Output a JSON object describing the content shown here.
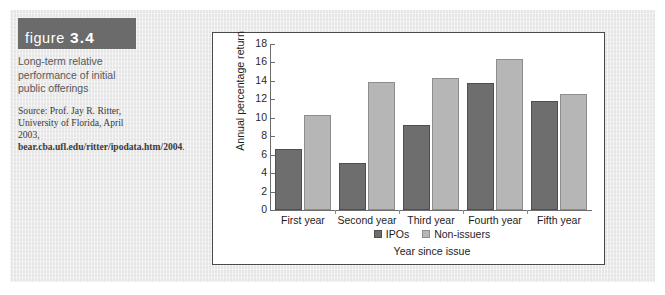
{
  "figure": {
    "banner_label": "figure",
    "banner_number": "3.4",
    "caption": "Long-term relative performance of initial public offerings",
    "source_prefix": "Source: Prof. Jay R. Ritter, University of Florida, April 2003, ",
    "source_url": "bear.cba.ufl.edu/ritter/ipodata.htm/2004",
    "source_suffix": "."
  },
  "colors": {
    "banner_bg": "#6b6b6b",
    "page_bg": "#e6e6e6",
    "series_ipos": "#6e6e6e",
    "series_nonissuers": "#b6b6b6",
    "axis": "#6d6d6d"
  },
  "chart_data": {
    "type": "bar",
    "title": "",
    "xlabel": "Year since issue",
    "ylabel": "Annual percentage return",
    "categories": [
      "First year",
      "Second year",
      "Third year",
      "Fourth year",
      "Fifth year"
    ],
    "series": [
      {
        "name": "IPOs",
        "values": [
          6.6,
          5.1,
          9.2,
          13.8,
          11.8
        ]
      },
      {
        "name": "Non-issuers",
        "values": [
          10.3,
          13.9,
          14.3,
          16.4,
          12.6
        ]
      }
    ],
    "ylim": [
      0,
      18
    ],
    "yticks": [
      0,
      2,
      4,
      6,
      8,
      10,
      12,
      14,
      16,
      18
    ],
    "grid": false,
    "legend_position": "bottom"
  }
}
